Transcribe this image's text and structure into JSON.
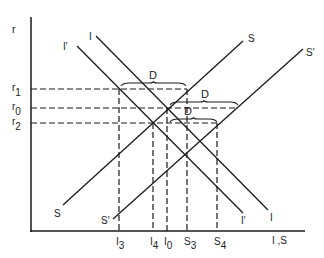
{
  "chart_data": {
    "type": "line",
    "title": "",
    "xlabel": "I ,S",
    "ylabel": "r",
    "grid": false,
    "series": [
      {
        "name": "I",
        "label": "I",
        "points": [
          [
            96,
            36
          ],
          [
            268,
            210
          ]
        ]
      },
      {
        "name": "I'",
        "label": "I'",
        "points": [
          [
            77,
            46
          ],
          [
            243,
            213
          ]
        ]
      },
      {
        "name": "S",
        "label": "S",
        "points": [
          [
            63,
            205
          ],
          [
            243,
            41
          ]
        ]
      },
      {
        "name": "S'",
        "label": "S'",
        "points": [
          [
            113,
            219
          ],
          [
            303,
            49
          ]
        ]
      }
    ],
    "y_levels": [
      {
        "label": "r1",
        "main": "r",
        "sub": "1",
        "y": 89,
        "x_end": 187
      },
      {
        "label": "r0",
        "main": "r",
        "sub": "0",
        "y": 108,
        "x_end": 238
      },
      {
        "label": "r2",
        "main": "r",
        "sub": "2",
        "y": 123,
        "x_end": 217
      }
    ],
    "x_ticks": [
      {
        "label": "I3",
        "main": "I",
        "sub": "3",
        "x": 119,
        "y_top": 89
      },
      {
        "label": "I4",
        "main": "I",
        "sub": "4",
        "x": 153,
        "y_top": 123
      },
      {
        "label": "I0",
        "main": "I",
        "sub": "0",
        "x": 167,
        "y_top": 108
      },
      {
        "label": "S3",
        "main": "S",
        "sub": "3",
        "x": 187,
        "y_top": 89
      },
      {
        "label": "S4",
        "main": "S",
        "sub": "4",
        "x": 217,
        "y_top": 123
      }
    ],
    "annotations": [
      {
        "text": "D",
        "x": 153,
        "y": 79,
        "brace_from": 121,
        "brace_to": 186,
        "brace_y": 84
      },
      {
        "text": "D",
        "x": 205,
        "y": 98,
        "brace_from": 170,
        "brace_to": 238,
        "brace_y": 103
      },
      {
        "text": "D",
        "x": 188,
        "y": 115,
        "brace_from": 170,
        "brace_to": 217,
        "brace_y": 120
      }
    ]
  },
  "axes": {
    "y_label": "r",
    "x_label": "I ,S"
  },
  "curve_labels": {
    "I_top": "I",
    "I_prime_top": "I'",
    "S_top": "S",
    "S_prime_top": "S'",
    "S_bottom": "S",
    "S_prime_bottom": "S'",
    "I_prime_bottom": "I'",
    "I_bottom": "I"
  },
  "colors": {
    "line": "#1a1a1a",
    "text": "#222222"
  }
}
